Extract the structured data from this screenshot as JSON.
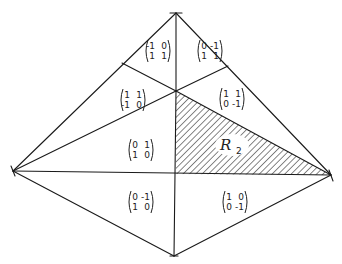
{
  "diagram": {
    "vertices": {
      "top": [
        176,
        13
      ],
      "left": [
        13,
        171
      ],
      "right": [
        331,
        175
      ],
      "bottom": [
        174,
        256
      ],
      "center": [
        176,
        91
      ],
      "upper_left_split": [
        122,
        63
      ],
      "upper_right_split": [
        228,
        66
      ],
      "mid": [
        176,
        174
      ]
    },
    "regions": [
      {
        "id": "m1",
        "matrix": [
          [
            "-1",
            "0"
          ],
          [
            "1",
            "1"
          ]
        ],
        "pos": [
          145,
          51
        ]
      },
      {
        "id": "m2",
        "matrix": [
          [
            "0",
            "-1"
          ],
          [
            "1",
            "1"
          ]
        ],
        "pos": [
          197,
          51
        ]
      },
      {
        "id": "m3",
        "matrix": [
          [
            "1",
            "1"
          ],
          [
            "-1",
            "0"
          ]
        ],
        "pos": [
          120,
          100
        ]
      },
      {
        "id": "m4",
        "matrix": [
          [
            "1",
            "1"
          ],
          [
            "0",
            "-1"
          ]
        ],
        "pos": [
          219,
          99
        ]
      },
      {
        "id": "m5",
        "matrix": [
          [
            "0",
            "1"
          ],
          [
            "1",
            "0"
          ]
        ],
        "pos": [
          128,
          150
        ]
      },
      {
        "id": "m6",
        "matrix": [
          [
            "0",
            "-1"
          ],
          [
            "1",
            "0"
          ]
        ],
        "pos": [
          128,
          202
        ]
      },
      {
        "id": "m7",
        "matrix": [
          [
            "1",
            "0"
          ],
          [
            "0",
            "-1"
          ]
        ],
        "pos": [
          222,
          202
        ]
      }
    ],
    "shaded_region": {
      "label": "R",
      "subscript": "2",
      "pattern": "diagonal-hatch",
      "color": "#222222"
    }
  }
}
